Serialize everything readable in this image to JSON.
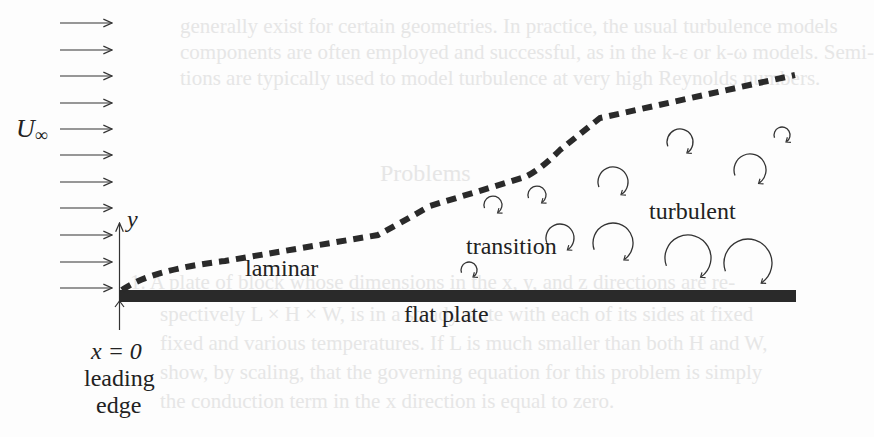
{
  "diagram": {
    "freestream_label": "U",
    "freestream_subscript": "∞",
    "axis_label": "y",
    "origin_label": "x = 0",
    "leading_edge_label_line1": "leading",
    "leading_edge_label_line2": "edge",
    "regions": {
      "laminar": "laminar",
      "transition": "transition",
      "turbulent": "turbulent"
    },
    "plate_label": "flat plate",
    "colors": {
      "ink": "#222222",
      "plate": "#2a2a2a",
      "background": "#fdfdfd",
      "bleed_through": "#e6e6e6"
    },
    "freestream_arrows_count": 11,
    "eddies": [
      {
        "cx": 469,
        "cy": 270,
        "r": 8
      },
      {
        "cx": 493,
        "cy": 205,
        "r": 9
      },
      {
        "cx": 537,
        "cy": 195,
        "r": 9
      },
      {
        "cx": 560,
        "cy": 238,
        "r": 14
      },
      {
        "cx": 613,
        "cy": 243,
        "r": 20
      },
      {
        "cx": 613,
        "cy": 182,
        "r": 15
      },
      {
        "cx": 680,
        "cy": 142,
        "r": 13
      },
      {
        "cx": 782,
        "cy": 135,
        "r": 8
      },
      {
        "cx": 750,
        "cy": 170,
        "r": 16
      },
      {
        "cx": 688,
        "cy": 258,
        "r": 23
      },
      {
        "cx": 748,
        "cy": 263,
        "r": 24
      }
    ]
  },
  "bleed_through_text": [
    "generally exist for certain geometries. In practice, the usual turbulence models",
    "components are often employed and successful, as in the k-ε or k-ω models. Semi-",
    "tions are typically used to model turbulence at very high Reynolds numbers.",
    "Problems",
    "1. A plate of block whose dimensions in the x, y, and z directions are re-",
    "spectively L × H × W, is in a steady state with each of its sides at fixed",
    "fixed and various temperatures. If L is much smaller than both H and W,",
    "show, by scaling, that the governing equation for this problem is simply",
    "the conduction term in the x direction is equal to zero."
  ]
}
